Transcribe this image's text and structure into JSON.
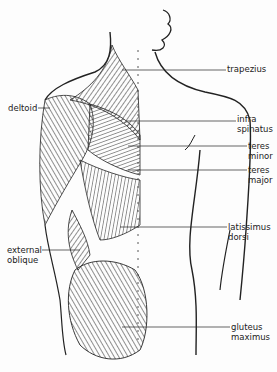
{
  "diagram": {
    "type": "anatomical illustration",
    "labels": {
      "trapezius": "trapezius",
      "deltoid": "deltoid",
      "infra_spinatus_1": "infra",
      "infra_spinatus_2": "spinatus",
      "teres_minor_1": "teres",
      "teres_minor_2": "minor",
      "teres_major_1": "teres",
      "teres_major_2": "major",
      "latissimus_1": "latissimus",
      "latissimus_2": "dorsi",
      "external_oblique_1": "external",
      "external_oblique_2": "oblique",
      "gluteus_1": "gluteus",
      "gluteus_2": "maximus"
    }
  }
}
